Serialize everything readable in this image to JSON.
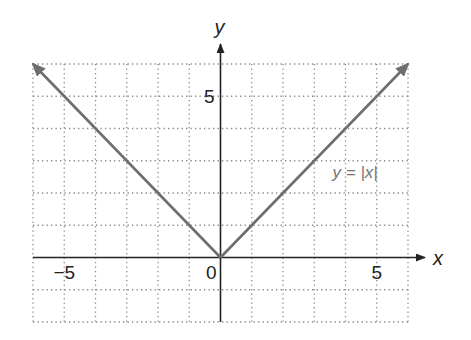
{
  "chart_data": {
    "type": "line",
    "title": "",
    "xlabel": "x",
    "ylabel": "y",
    "xlim": [
      -6,
      6
    ],
    "ylim": [
      -2,
      6
    ],
    "grid": true,
    "grid_style": "dotted",
    "x_ticks": [
      {
        "value": -5,
        "label": "−5"
      },
      {
        "value": 0,
        "label": "0"
      },
      {
        "value": 5,
        "label": "5"
      }
    ],
    "y_ticks": [
      {
        "value": 5,
        "label": "5"
      }
    ],
    "series": [
      {
        "name": "y = |x|",
        "x": [
          -6,
          -5,
          -4,
          -3,
          -2,
          -1,
          0,
          1,
          2,
          3,
          4,
          5,
          6
        ],
        "y": [
          6,
          5,
          4,
          3,
          2,
          1,
          0,
          1,
          2,
          3,
          4,
          5,
          6
        ],
        "color": "#6e6e6e",
        "arrows_at_ends": true
      }
    ],
    "annotations": [
      {
        "text": "y = |x|",
        "x": 4.5,
        "y": 2.6
      }
    ],
    "colors": {
      "axis": "#222222",
      "grid": "#888888",
      "line": "#6e6e6e",
      "label": "#777777"
    }
  }
}
